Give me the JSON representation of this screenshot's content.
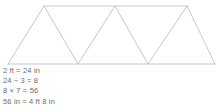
{
  "figure": {
    "name": "triangle-truss",
    "stroke_color": "#b9b9b9",
    "background_color": "#ffffff",
    "stroke_width": 0.8,
    "top_rail": {
      "x1": 44,
      "y1": 6,
      "x2": 188,
      "y2": 6
    },
    "bottom_rail": {
      "x1": 8,
      "y1": 64,
      "x2": 215,
      "y2": 64
    },
    "zigzag_points": "8,64 44,6 78,64 115,6 148,64 187,6 215,64",
    "apex_points": [
      {
        "label": "apex-left",
        "x": 44,
        "y": 6
      },
      {
        "label": "apex-middle",
        "x": 115,
        "y": 6
      },
      {
        "label": "apex-right",
        "x": 187,
        "y": 6
      }
    ],
    "base_points": [
      {
        "label": "base-left",
        "x": 8,
        "y": 64
      },
      {
        "label": "base-inner-left",
        "x": 78,
        "y": 64
      },
      {
        "label": "base-inner-right",
        "x": 148,
        "y": 64
      },
      {
        "label": "base-right",
        "x": 215,
        "y": 64
      }
    ]
  },
  "work": {
    "text_color": "#6d6d6d",
    "lines": [
      {
        "id": "line-1",
        "text": "2 ft = 24 in"
      },
      {
        "id": "line-2",
        "text": "24 ÷ 3 = 8"
      },
      {
        "id": "line-3",
        "text": "8 × 7 = 56"
      },
      {
        "id": "line-4",
        "text": "56 in = 4 ft 8 in"
      }
    ]
  }
}
